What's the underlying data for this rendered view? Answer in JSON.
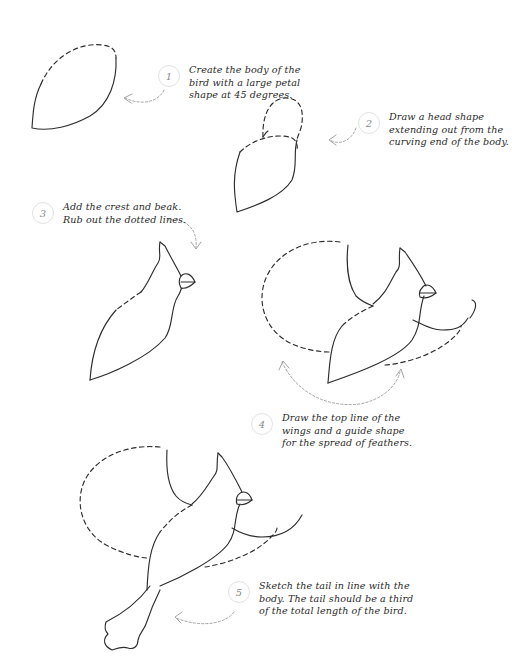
{
  "colors": {
    "line": "#2d2d2d",
    "guide_arrow": "#9a9a9a",
    "step_circle_border": "#e2e2e2",
    "step_number": "#8a8a8a",
    "text": "#2a2a2a",
    "background": "#ffffff"
  },
  "steps": [
    {
      "number": "1",
      "lines": [
        "Create the body of the",
        "bird with a large petal",
        "shape at 45 degrees."
      ]
    },
    {
      "number": "2",
      "lines": [
        "Draw a head shape",
        "extending out from the",
        "curving end of the body."
      ]
    },
    {
      "number": "3",
      "lines": [
        "Add the crest and beak.",
        "Rub out the dotted lines."
      ]
    },
    {
      "number": "4",
      "lines": [
        "Draw the top line of the",
        "wings and a guide shape",
        "for the spread of feathers."
      ]
    },
    {
      "number": "5",
      "lines": [
        "Sketch the tail in line with the",
        "body. The tail should be a third",
        "of the total length of the bird."
      ]
    }
  ],
  "figures": [
    {
      "id": "fig-1",
      "label": "petal-shaped body"
    },
    {
      "id": "fig-2",
      "label": "body with head shape"
    },
    {
      "id": "fig-3",
      "label": "body with crest and beak"
    },
    {
      "id": "fig-4",
      "label": "bird with wing lines and feather guide"
    },
    {
      "id": "fig-5",
      "label": "bird with wings and tail"
    }
  ]
}
